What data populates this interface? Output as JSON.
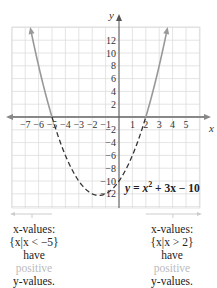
{
  "chart_data": {
    "type": "line",
    "title": "",
    "xlabel": "x",
    "ylabel": "y",
    "equation": "y = x² + 3x − 10",
    "xlim": [
      -8,
      6
    ],
    "ylim": [
      -14,
      14
    ],
    "grid": true,
    "x_ticks": [
      -7,
      -6,
      -5,
      -4,
      -3,
      -2,
      -1,
      1,
      2,
      3,
      4,
      5
    ],
    "y_ticks": [
      -12,
      -10,
      -8,
      -6,
      -4,
      -2,
      2,
      4,
      6,
      8,
      10,
      12
    ],
    "x_tick_labels": [
      "−7",
      "−6",
      "−5",
      "−4",
      "−3",
      "−2",
      "−1",
      "1",
      "2",
      "3",
      "4",
      "5"
    ],
    "y_tick_labels": [
      "−12",
      "−10",
      "−8",
      "−6",
      "−4",
      "−2",
      "2",
      "4",
      "6",
      "8",
      "10",
      "12"
    ],
    "series": [
      {
        "name": "y = x^2 + 3x - 10",
        "style": "solid where y>0, dashed where y<0",
        "x": [
          -6.6,
          -6,
          -5,
          -4,
          -3,
          -2,
          -1.5,
          -1,
          0,
          1,
          2,
          3,
          3.6
        ],
        "y": [
          13.8,
          8,
          0,
          -6,
          -10,
          -12,
          -12.25,
          -12,
          -10,
          -6,
          0,
          8,
          13.8
        ]
      }
    ],
    "roots": [
      -5,
      2
    ],
    "vertex": [
      -1.5,
      -12.25
    ],
    "annotations": [
      {
        "region": "x < -5",
        "text": "x-values: {x|x < −5} have positive y-values."
      },
      {
        "region": "x > 2",
        "text": "x-values: {x|x > 2} have positive y-values."
      }
    ]
  },
  "labels": {
    "x_axis": "x",
    "y_axis": "y",
    "equation_lhs": "y = x",
    "equation_exp": "2",
    "equation_rhs": " + 3x − 10"
  },
  "captions": {
    "left": {
      "line1": "x-values:",
      "line2": "{x|x < −5}",
      "line3": "have",
      "line4": "positive",
      "line5": "y-values."
    },
    "right": {
      "line1": "x-values:",
      "line2": "{x|x > 2}",
      "line3": "have",
      "line4": "positive",
      "line5": "y-values."
    }
  },
  "colors": {
    "grid": "#dddddd",
    "axis": "#555555",
    "curve_solid": "#999999",
    "curve_dashed": "#333333",
    "faint_text": "#bbbbbb"
  }
}
